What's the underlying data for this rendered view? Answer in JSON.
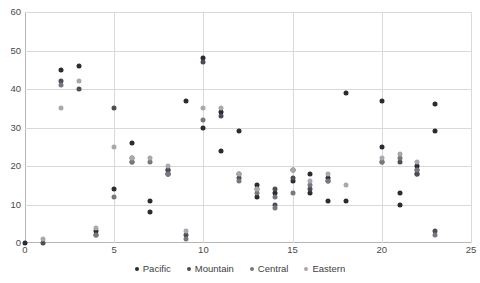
{
  "chart_data": {
    "type": "scatter",
    "title": "",
    "xlabel": "",
    "ylabel": "",
    "xlim": [
      0,
      25
    ],
    "ylim": [
      0,
      60
    ],
    "xticks": [
      0,
      5,
      10,
      15,
      20,
      25
    ],
    "yticks": [
      0,
      10,
      20,
      30,
      40,
      50,
      60
    ],
    "grid": true,
    "legend_position": "bottom",
    "colors": {
      "Pacific": "#2b2b33",
      "Mountain": "#4d4d57",
      "Central": "#77777f",
      "Eastern": "#a8a8ad"
    },
    "series": [
      {
        "name": "Pacific",
        "color": "#2b2b33",
        "points": [
          [
            0,
            0
          ],
          [
            2,
            45
          ],
          [
            3,
            46
          ],
          [
            4,
            3
          ],
          [
            5,
            14
          ],
          [
            6,
            26
          ],
          [
            7,
            11
          ],
          [
            7,
            8
          ],
          [
            8,
            19
          ],
          [
            8,
            18
          ],
          [
            9,
            37
          ],
          [
            10,
            48
          ],
          [
            10,
            30
          ],
          [
            11,
            34
          ],
          [
            11,
            24
          ],
          [
            12,
            29
          ],
          [
            12,
            18
          ],
          [
            13,
            15
          ],
          [
            13,
            12
          ],
          [
            14,
            13
          ],
          [
            15,
            19
          ],
          [
            15,
            16
          ],
          [
            16,
            18
          ],
          [
            16,
            13
          ],
          [
            17,
            17
          ],
          [
            17,
            11
          ],
          [
            18,
            39
          ],
          [
            18,
            11
          ],
          [
            20,
            37
          ],
          [
            20,
            25
          ],
          [
            21,
            13
          ],
          [
            21,
            10
          ],
          [
            22,
            20
          ],
          [
            22,
            18
          ],
          [
            23,
            36
          ],
          [
            23,
            29
          ]
        ]
      },
      {
        "name": "Mountain",
        "color": "#4d4d57",
        "points": [
          [
            1,
            0
          ],
          [
            2,
            42
          ],
          [
            3,
            40
          ],
          [
            4,
            2
          ],
          [
            5,
            35
          ],
          [
            6,
            22
          ],
          [
            6,
            21
          ],
          [
            8,
            19
          ],
          [
            8,
            18
          ],
          [
            9,
            2
          ],
          [
            10,
            47
          ],
          [
            11,
            33
          ],
          [
            12,
            17
          ],
          [
            13,
            14
          ],
          [
            14,
            14
          ],
          [
            14,
            10
          ],
          [
            15,
            17
          ],
          [
            16,
            14
          ],
          [
            17,
            16
          ],
          [
            20,
            21
          ],
          [
            21,
            21
          ],
          [
            22,
            19
          ],
          [
            22,
            18
          ],
          [
            23,
            3
          ]
        ]
      },
      {
        "name": "Central",
        "color": "#77777f",
        "points": [
          [
            2,
            41
          ],
          [
            4,
            2
          ],
          [
            5,
            12
          ],
          [
            6,
            21
          ],
          [
            7,
            21
          ],
          [
            8,
            18
          ],
          [
            9,
            1
          ],
          [
            10,
            32
          ],
          [
            12,
            16
          ],
          [
            13,
            13
          ],
          [
            14,
            12
          ],
          [
            14,
            9
          ],
          [
            15,
            13
          ],
          [
            16,
            15
          ],
          [
            17,
            16
          ],
          [
            20,
            21
          ],
          [
            21,
            22
          ],
          [
            22,
            19
          ],
          [
            23,
            2
          ]
        ]
      },
      {
        "name": "Eastern",
        "color": "#a8a8ad",
        "points": [
          [
            1,
            1
          ],
          [
            2,
            35
          ],
          [
            3,
            42
          ],
          [
            4,
            4
          ],
          [
            5,
            25
          ],
          [
            6,
            22
          ],
          [
            7,
            22
          ],
          [
            8,
            20
          ],
          [
            9,
            3
          ],
          [
            10,
            35
          ],
          [
            11,
            35
          ],
          [
            12,
            18
          ],
          [
            13,
            14
          ],
          [
            15,
            19
          ],
          [
            16,
            16
          ],
          [
            17,
            18
          ],
          [
            18,
            15
          ],
          [
            20,
            22
          ],
          [
            21,
            23
          ],
          [
            22,
            21
          ]
        ]
      }
    ]
  },
  "axes": {
    "y_labels": [
      "60",
      "50",
      "40",
      "30",
      "20",
      "10",
      "0"
    ],
    "x_labels": [
      "0",
      "5",
      "10",
      "15",
      "20",
      "25"
    ]
  },
  "legend": {
    "items": [
      {
        "label": "Pacific",
        "color": "#2b2b33"
      },
      {
        "label": "Mountain",
        "color": "#4d4d57"
      },
      {
        "label": "Central",
        "color": "#77777f"
      },
      {
        "label": "Eastern",
        "color": "#a8a8ad"
      }
    ]
  }
}
